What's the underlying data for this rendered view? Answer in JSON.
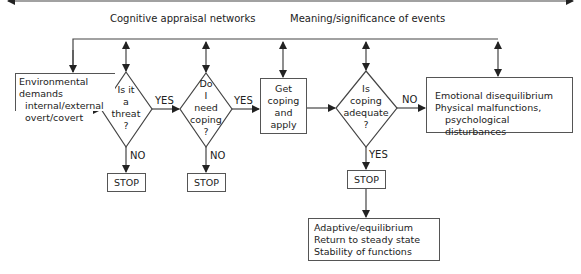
{
  "header": {
    "label_left": "Cognitive appraisal networks",
    "label_right": "Meaning/significance of events"
  },
  "nodes": {
    "env_demands": {
      "line1": "Environmental demands",
      "line2": "internal/external",
      "line3": "overt/covert"
    },
    "threat_decision": {
      "line1": "Is it",
      "line2": "a",
      "line3": "threat",
      "line4": "?"
    },
    "need_coping_decision": {
      "line1": "Do",
      "line2": "I",
      "line3": "need",
      "line4": "coping",
      "line5": "?"
    },
    "get_coping": {
      "line1": "Get",
      "line2": "coping",
      "line3": "and",
      "line4": "apply"
    },
    "coping_adequate_decision": {
      "line1": "Is",
      "line2": "coping",
      "line3": "adequate",
      "line4": "?"
    },
    "disequilibrium": {
      "line1": "Emotional disequilibrium",
      "line2": "Physical malfunctions,",
      "line3": "psychological disturbances"
    },
    "stop1": {
      "label": "STOP"
    },
    "stop2": {
      "label": "STOP"
    },
    "stop3": {
      "label": "STOP"
    },
    "adaptive": {
      "line1": "Adaptive/equilibrium",
      "line2": "Return to steady state",
      "line3": "Stability of functions"
    }
  },
  "edge_labels": {
    "threat_yes": "YES",
    "threat_no": "NO",
    "need_yes": "YES",
    "need_no": "NO",
    "adequate_no": "NO",
    "adequate_yes": "YES"
  },
  "colors": {
    "line": "#444444",
    "text": "#222222",
    "background": "#ffffff"
  }
}
